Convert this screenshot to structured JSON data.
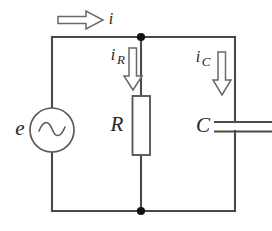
{
  "diagram": {
    "type": "electrical-schematic",
    "background_color": "#ffffff",
    "wire_color": "#4a4a4a",
    "label_color": "#262626",
    "arrow_fill": "#ffffff",
    "arrow_stroke": "#6a6a6a",
    "node_color": "#111111"
  },
  "labels": {
    "source": "e",
    "resistor": "R",
    "capacitor": "C",
    "current_total": "i",
    "current_resistor_base": "i",
    "current_resistor_sub": "R",
    "current_capacitor_base": "i",
    "current_capacitor_sub": "C"
  },
  "components": [
    {
      "id": "source",
      "kind": "ac-voltage-source",
      "label": "e",
      "symbol": "circle-with-sine",
      "branch": "left"
    },
    {
      "id": "resistor",
      "kind": "resistor",
      "label": "R",
      "symbol": "rectangle",
      "branch": "middle"
    },
    {
      "id": "capacitor",
      "kind": "capacitor",
      "label": "C",
      "symbol": "parallel-plates",
      "branch": "right"
    }
  ],
  "currents": [
    {
      "id": "i",
      "label": "i",
      "subscript": "",
      "direction": "right",
      "location": "top-wire"
    },
    {
      "id": "iR",
      "label": "i",
      "subscript": "R",
      "direction": "down",
      "location": "resistor-branch"
    },
    {
      "id": "iC",
      "label": "i",
      "subscript": "C",
      "direction": "down",
      "location": "capacitor-branch"
    }
  ],
  "nodes": [
    {
      "id": "top-node",
      "x": 141,
      "y": 37
    },
    {
      "id": "bottom-node",
      "x": 141,
      "y": 211
    }
  ]
}
